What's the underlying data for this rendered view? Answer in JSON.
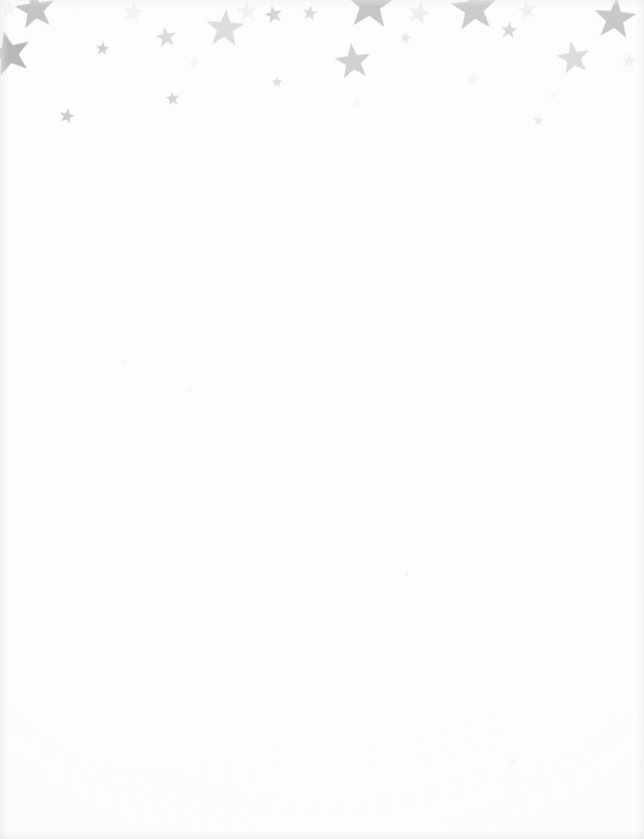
{
  "page": {
    "kind": "scanned-blank-stationery",
    "width": 644,
    "height": 839,
    "paper_color": "#fdfdfd",
    "body_text": "",
    "body_note": "blank writing area — no text on page"
  },
  "decoration": {
    "name": "star-border",
    "motif": "five-pointed-star",
    "placement": "top band",
    "band_height": 150,
    "count": 27,
    "palette": {
      "darkest": "#b8b8b8",
      "mid": "#d4d4d4",
      "light": "#e6e6e6",
      "faintest": "#f1f1f1"
    },
    "stars": [
      {
        "name": "star-top-left-clipped",
        "x": 14,
        "y": -12,
        "size": 42,
        "rotate": -8,
        "color": "#c2c2c2",
        "opacity": 0.95
      },
      {
        "name": "star-left-edge-clipped",
        "x": -14,
        "y": 30,
        "size": 46,
        "rotate": -14,
        "color": "#b8b8b8",
        "opacity": 1.0
      },
      {
        "name": "star-small-1",
        "x": 95,
        "y": 41,
        "size": 15,
        "rotate": 6,
        "color": "#cfcfcf",
        "opacity": 0.95
      },
      {
        "name": "star-small-2",
        "x": 155,
        "y": 26,
        "size": 22,
        "rotate": -10,
        "color": "#d8d8d8",
        "opacity": 0.9
      },
      {
        "name": "star-small-3",
        "x": 59,
        "y": 108,
        "size": 16,
        "rotate": 12,
        "color": "#c9c9c9",
        "opacity": 0.95
      },
      {
        "name": "star-small-4",
        "x": 165,
        "y": 91,
        "size": 15,
        "rotate": -6,
        "color": "#d2d2d2",
        "opacity": 0.9
      },
      {
        "name": "star-medium-1",
        "x": 205,
        "y": 8,
        "size": 40,
        "rotate": 4,
        "color": "#dcdcdc",
        "opacity": 0.95
      },
      {
        "name": "star-small-5",
        "x": 264,
        "y": 5,
        "size": 19,
        "rotate": -12,
        "color": "#d0d0d0",
        "opacity": 0.9
      },
      {
        "name": "star-small-6",
        "x": 302,
        "y": 5,
        "size": 16,
        "rotate": 8,
        "color": "#d6d6d6",
        "opacity": 0.9
      },
      {
        "name": "star-tiny-1",
        "x": 271,
        "y": 76,
        "size": 12,
        "rotate": 0,
        "color": "#dcdcdc",
        "opacity": 0.85
      },
      {
        "name": "star-large-top-1",
        "x": 344,
        "y": -22,
        "size": 52,
        "rotate": 3,
        "color": "#c4c4c4",
        "opacity": 0.95
      },
      {
        "name": "star-medium-2",
        "x": 334,
        "y": 42,
        "size": 38,
        "rotate": -7,
        "color": "#cfcfcf",
        "opacity": 0.95
      },
      {
        "name": "star-tiny-2",
        "x": 399,
        "y": 31,
        "size": 13,
        "rotate": 10,
        "color": "#e4e4e4",
        "opacity": 0.85
      },
      {
        "name": "star-large-top-2",
        "x": 450,
        "y": -16,
        "size": 48,
        "rotate": -5,
        "color": "#cacaca",
        "opacity": 0.95
      },
      {
        "name": "star-small-7",
        "x": 500,
        "y": 21,
        "size": 18,
        "rotate": 6,
        "color": "#d5d5d5",
        "opacity": 0.9
      },
      {
        "name": "star-medium-3",
        "x": 556,
        "y": 40,
        "size": 35,
        "rotate": -9,
        "color": "#dadada",
        "opacity": 0.9
      },
      {
        "name": "star-large-right",
        "x": 593,
        "y": -4,
        "size": 44,
        "rotate": 5,
        "color": "#c6c6c6",
        "opacity": 0.95
      },
      {
        "name": "star-tiny-3",
        "x": 533,
        "y": 115,
        "size": 11,
        "rotate": 0,
        "color": "#e8e8e8",
        "opacity": 0.8
      },
      {
        "name": "star-faint-1",
        "x": 406,
        "y": 0,
        "size": 26,
        "rotate": 14,
        "color": "#ededed",
        "opacity": 0.8
      },
      {
        "name": "star-faint-2",
        "x": 236,
        "y": 0,
        "size": 22,
        "rotate": -4,
        "color": "#efefef",
        "opacity": 0.75
      },
      {
        "name": "star-faint-3",
        "x": 121,
        "y": 0,
        "size": 24,
        "rotate": 9,
        "color": "#f0f0f0",
        "opacity": 0.7
      },
      {
        "name": "star-faint-4",
        "x": 517,
        "y": 0,
        "size": 20,
        "rotate": -11,
        "color": "#eeeeee",
        "opacity": 0.75
      },
      {
        "name": "star-faint-5",
        "x": 620,
        "y": 52,
        "size": 18,
        "rotate": 7,
        "color": "#f0f0f0",
        "opacity": 0.7
      },
      {
        "name": "star-faint-6",
        "x": 0,
        "y": 0,
        "size": 18,
        "rotate": 0,
        "color": "#f1f1f1",
        "opacity": 0.65
      },
      {
        "name": "star-faint-7",
        "x": 188,
        "y": 57,
        "size": 13,
        "rotate": 5,
        "color": "#f1f1f1",
        "opacity": 0.6
      },
      {
        "name": "star-faint-8",
        "x": 351,
        "y": 96,
        "size": 12,
        "rotate": -8,
        "color": "#f2f2f2",
        "opacity": 0.55
      },
      {
        "name": "star-faint-9",
        "x": 466,
        "y": 72,
        "size": 14,
        "rotate": 11,
        "color": "#f1f1f1",
        "opacity": 0.6
      }
    ]
  }
}
